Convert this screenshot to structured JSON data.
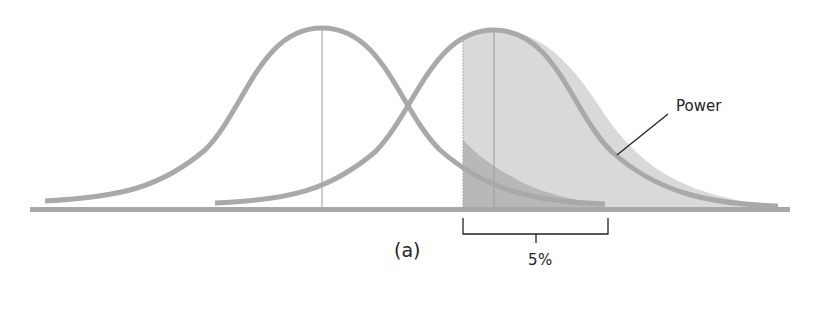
{
  "figure": {
    "panel_label": "(a)",
    "power_label": "Power",
    "alpha_label": "5%",
    "colors": {
      "curve": "#a9a9a9",
      "baseline": "#a9a9a9",
      "power_fill": "#d9d9d9",
      "alpha_fill": "#b8b8b8",
      "mean_line": "#999999",
      "annotation": "#222222"
    },
    "distributions": [
      {
        "name": "null-distribution",
        "mean_x": 322,
        "peak_y": 28
      },
      {
        "name": "alternative-distribution",
        "mean_x": 494,
        "peak_y": 30
      }
    ],
    "critical_value_x": 463
  }
}
